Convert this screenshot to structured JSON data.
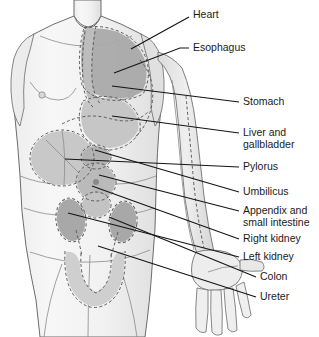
{
  "figure": {
    "width": 319,
    "height": 337,
    "background_color": "#ffffff"
  },
  "colors": {
    "background": "#ffffff",
    "skin_light": "#f4f4f4",
    "skin_shade": "#e3e3e3",
    "organ_dark": "#a9a9a9",
    "organ_mid": "#bcbcbc",
    "organ_light": "#d2d2d2",
    "dashed_outline": "#5a5a5a",
    "body_outline": "#4d4d4d",
    "leader_line": "#141414",
    "label_text": "#1a1a1a"
  },
  "labels": [
    {
      "id": "heart",
      "text": "Heart",
      "text_x": 193,
      "text_y": 15,
      "leader": "M 189 17 L 131 49"
    },
    {
      "id": "esophagus",
      "text": "Esophagus",
      "text_x": 193,
      "text_y": 48,
      "leader": "M 189 48 L 180 48 L 114 73"
    },
    {
      "id": "stomach",
      "text": "Stomach",
      "text_x": 243,
      "text_y": 102,
      "leader": "M 239 102 L 112 86"
    },
    {
      "id": "liver-gallbladder",
      "text": "Liver and",
      "text2": "gallbladder",
      "text_x": 243,
      "text_y": 133,
      "text2_y": 145,
      "leader": "M 239 133 L 112 116"
    },
    {
      "id": "pylorus",
      "text": "Pylorus",
      "text_x": 243,
      "text_y": 167,
      "leader": "M 239 167 L 65 159"
    },
    {
      "id": "umbilicus",
      "text": "Umbilicus",
      "text_x": 243,
      "text_y": 192,
      "leader": "M 239 192 L 95 150"
    },
    {
      "id": "appendix-small-intestine",
      "text": "Appendix and",
      "text2": "small intestine",
      "text_x": 243,
      "text_y": 211,
      "text2_y": 223,
      "leader": "M 239 211 L 99 175"
    },
    {
      "id": "right-kidney",
      "text": "Right kidney",
      "text_x": 243,
      "text_y": 239,
      "leader": "M 239 239 L 92 186"
    },
    {
      "id": "left-kidney",
      "text": "Left kidney",
      "text_x": 243,
      "text_y": 257,
      "leader": "M 239 257 L 68 213"
    },
    {
      "id": "colon",
      "text": "Colon",
      "text_x": 260,
      "text_y": 277,
      "leader": "M 256 277 L 109 217"
    },
    {
      "id": "ureter",
      "text": "Ureter",
      "text_x": 260,
      "text_y": 297,
      "leader": "M 256 297 L 98 246"
    }
  ],
  "organ_regions": [
    {
      "id": "lung-heart-mass",
      "label": "Heart and lung field",
      "shade": "#a9a9a9"
    },
    {
      "id": "esophagus-tract",
      "label": "Esophagus",
      "shade": "#bcbcbc"
    },
    {
      "id": "stomach-region",
      "label": "Stomach",
      "shade": "#c6c6c6"
    },
    {
      "id": "liver-region",
      "label": "Liver and gallbladder",
      "shade": "#c8c8c8"
    },
    {
      "id": "pylorus-region",
      "label": "Pylorus",
      "shade": "#b4b4b4"
    },
    {
      "id": "umbilicus-region",
      "label": "Umbilicus",
      "shade": "#bdbdbd"
    },
    {
      "id": "small-intestine-region",
      "label": "Appendix and small intestine",
      "shade": "#c3c3c3"
    },
    {
      "id": "right-kidney-region",
      "label": "Right kidney",
      "shade": "#a6a6a6"
    },
    {
      "id": "left-kidney-region",
      "label": "Left kidney",
      "shade": "#a6a6a6"
    },
    {
      "id": "colon-region",
      "label": "Colon",
      "shade": "#cfcfcf"
    },
    {
      "id": "ureter-region",
      "label": "Ureter",
      "shade": "#c9c9c9"
    }
  ]
}
